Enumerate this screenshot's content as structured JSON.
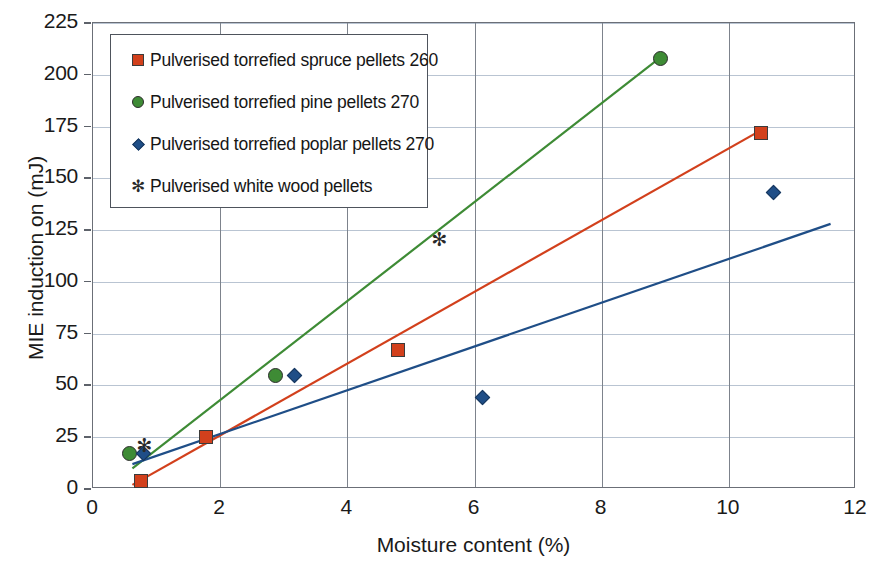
{
  "chart_data": {
    "type": "scatter",
    "title": "",
    "xlabel": "Moisture content (%)",
    "ylabel": "MIE induction on (mJ)",
    "xlim": [
      0,
      12
    ],
    "ylim": [
      0,
      225
    ],
    "xticks": [
      0,
      2,
      4,
      6,
      8,
      10,
      12
    ],
    "yticks": [
      0,
      25,
      50,
      75,
      100,
      125,
      150,
      175,
      200,
      225
    ],
    "grid": "horizontal-and-vertical",
    "legend_position": "top-left-inside",
    "series": [
      {
        "name": "Pulverised torrefied spruce pellets 260",
        "marker": "square",
        "color": "#d2401c",
        "points": [
          {
            "x": 0.75,
            "y": 4
          },
          {
            "x": 1.78,
            "y": 25
          },
          {
            "x": 4.8,
            "y": 67
          },
          {
            "x": 10.5,
            "y": 172
          }
        ],
        "trendline": {
          "x1": 0.62,
          "y1": 2,
          "x2": 10.55,
          "y2": 174
        }
      },
      {
        "name": "Pulverised torrefied pine pellets 270",
        "marker": "circle",
        "color": "#3e8b35",
        "points": [
          {
            "x": 0.58,
            "y": 17
          },
          {
            "x": 2.87,
            "y": 55
          },
          {
            "x": 8.93,
            "y": 208
          }
        ],
        "trendline": {
          "x1": 0.62,
          "y1": 10,
          "x2": 8.95,
          "y2": 209
        }
      },
      {
        "name": "Pulverised torrefied poplar pellets 270",
        "marker": "diamond",
        "color": "#1f4e87",
        "points": [
          {
            "x": 0.8,
            "y": 17
          },
          {
            "x": 3.17,
            "y": 55
          },
          {
            "x": 6.13,
            "y": 44
          },
          {
            "x": 10.7,
            "y": 143
          }
        ],
        "trendline": {
          "x1": 0.62,
          "y1": 12,
          "x2": 11.6,
          "y2": 128
        }
      },
      {
        "name": "Pulverised white wood pellets",
        "marker": "star",
        "color": "#2a2a2a",
        "points": [
          {
            "x": 0.78,
            "y": 21
          },
          {
            "x": 5.42,
            "y": 120
          }
        ],
        "trendline": null
      }
    ]
  },
  "legend": {
    "entries": [
      {
        "label": "Pulverised torrefied spruce pellets 260",
        "marker": "square"
      },
      {
        "label": "Pulverised torrefied pine pellets 270",
        "marker": "circle"
      },
      {
        "label": "Pulverised torrefied poplar pellets 270",
        "marker": "diamond"
      },
      {
        "label": "Pulverised white wood pellets",
        "marker": "star"
      }
    ]
  },
  "colors": {
    "spruce_red": "#d2401c",
    "pine_green": "#3e8b35",
    "poplar_blue": "#1f4e87",
    "white_wood_black": "#2a2a2a",
    "gridline": "#b9c4d2",
    "axis": "#6b6f77"
  },
  "icons": {
    "square_marker": "square-marker-icon",
    "circle_marker": "circle-marker-icon",
    "diamond_marker": "diamond-marker-icon",
    "star_marker": "star-marker-icon"
  },
  "glyphs": {
    "star": "✻"
  }
}
